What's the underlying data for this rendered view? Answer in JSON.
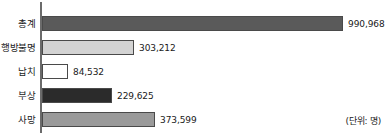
{
  "chart_data": {
    "type": "bar",
    "orientation": "horizontal",
    "title": "",
    "xlabel": "",
    "ylabel": "",
    "unit_note": "(단위: 명)",
    "grid": false,
    "legend": "none",
    "xlim": [
      0,
      990968
    ],
    "categories": [
      "총계",
      "행방불명",
      "납치",
      "부상",
      "사망"
    ],
    "values": [
      990968,
      303212,
      84532,
      229625,
      373599
    ],
    "value_labels": [
      "990,968",
      "303,212",
      "84,532",
      "229,625",
      "373,599"
    ],
    "bar_colors": [
      "#5a5a5a",
      "#d3d3d3",
      "#ffffff",
      "#2b2b2b",
      "#9a9a9a"
    ],
    "bar_border_color": "#4a4a4a",
    "axis_color": "#6b6b6b",
    "bars": [
      {
        "label": "총계",
        "value": 990968,
        "value_label": "990,968",
        "fill": "#5a5a5a"
      },
      {
        "label": "행방불명",
        "value": 303212,
        "value_label": "303,212",
        "fill": "#d3d3d3"
      },
      {
        "label": "납치",
        "value": 84532,
        "value_label": "84,532",
        "fill": "#ffffff"
      },
      {
        "label": "부상",
        "value": 229625,
        "value_label": "229,625",
        "fill": "#2b2b2b"
      },
      {
        "label": "사망",
        "value": 373599,
        "value_label": "373,599",
        "fill": "#9a9a9a"
      }
    ]
  }
}
